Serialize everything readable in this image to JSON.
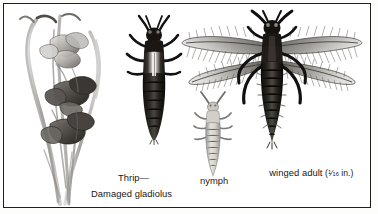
{
  "plate": {
    "background_color": "#ffffff",
    "frame_color": "#231f1c",
    "ink_color": "#1b1814",
    "medium": "grayscale wash and pen illustration"
  },
  "labels": {
    "wingless_adult": {
      "line1": "Thrip—",
      "line2": "wingless adult"
    },
    "nymph": "nymph",
    "winged_adult": {
      "text": "winged adult",
      "measure_open": "(",
      "numerator": "1",
      "solidus": "⁄",
      "denominator": "16",
      "unit": " in.)"
    },
    "damaged_plant": "Damaged gladiolus"
  },
  "figures": [
    {
      "name": "damaged-gladiolus",
      "caption": "Damaged gladiolus",
      "description": "Grayscale wash sketch of a gladiolus flower spike with streaked and withered blooms"
    },
    {
      "name": "wingless-adult-thrip",
      "caption": "Thrip—wingless adult",
      "description": "Dark elongated wingless adult thrips, dorsal view, with antennae and six legs"
    },
    {
      "name": "thrip-nymph",
      "caption": "nymph",
      "description": "Pale slender segmented nymph, dorsal view"
    },
    {
      "name": "winged-adult-thrip",
      "caption": "winged adult (1/16 in.)",
      "description": "Dark adult thrips with four long narrow fringed wings spread laterally"
    }
  ]
}
